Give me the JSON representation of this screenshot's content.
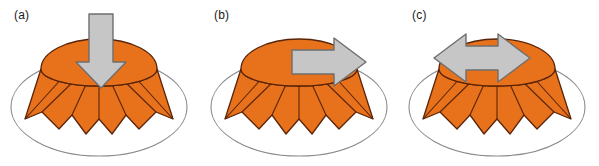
{
  "figure": {
    "width": 599,
    "height": 166,
    "background_color": "#ffffff",
    "panel_count": 3
  },
  "style": {
    "dome_fill": "#E8721C",
    "dome_stroke": "#5A2408",
    "arrow_fill": "#C6C6C6",
    "arrow_stroke": "#6E6E6E",
    "ellipse_stroke": "#8A8A8A",
    "label_color": "#1a1a1a"
  },
  "panels": [
    {
      "id": "a",
      "label": "(a)",
      "arrow_name": "down-arrow-icon",
      "arrow_direction": "down",
      "arrow_type": "single-headed",
      "arrow_orientation": "vertical",
      "load_description": "axial compression load applied downward onto the dome apex"
    },
    {
      "id": "b",
      "label": "(b)",
      "arrow_name": "right-arrow-icon",
      "arrow_direction": "right",
      "arrow_type": "single-headed",
      "arrow_orientation": "horizontal",
      "load_description": "lateral shear load applied horizontally to the right across the dome"
    },
    {
      "id": "c",
      "label": "(c)",
      "arrow_name": "left-right-arrow-icon",
      "arrow_direction": "left-right",
      "arrow_type": "double-headed",
      "arrow_orientation": "horizontal",
      "load_description": "bidirectional alternating horizontal load across the dome"
    }
  ]
}
